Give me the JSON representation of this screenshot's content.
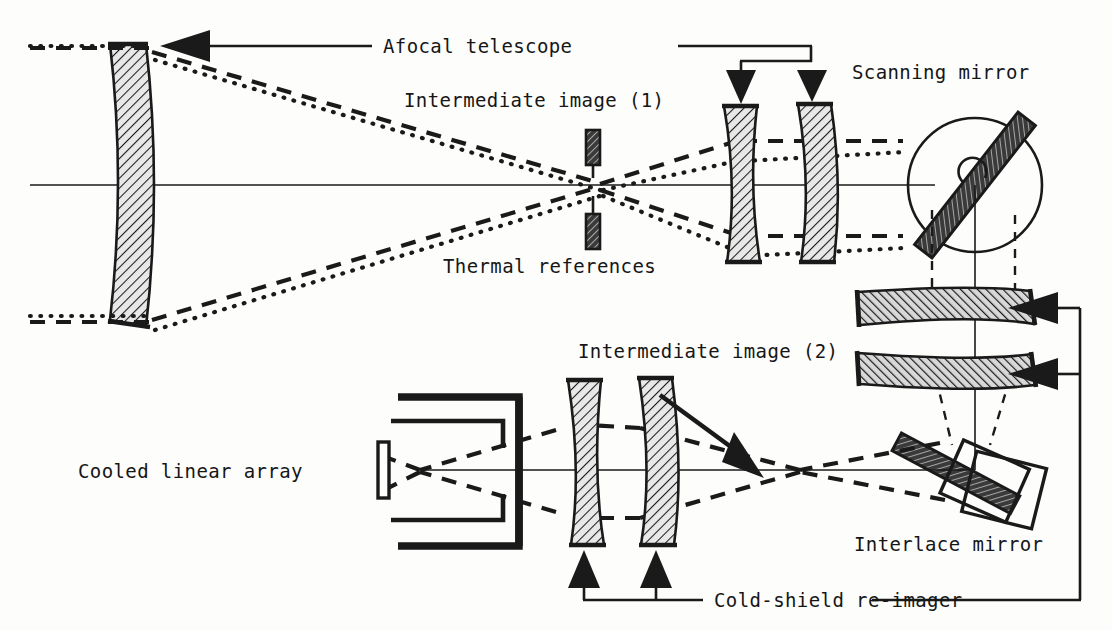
{
  "figure": {
    "kind": "optical-system-schematic",
    "title_visible": false,
    "background_color": "#fdfdfb",
    "ink_color": "#1a1a1a"
  },
  "labels": {
    "afocal_telescope": "Afocal telescope",
    "intermediate_image_1": "Intermediate image (1)",
    "scanning_mirror": "Scanning mirror",
    "thermal_references": "Thermal references",
    "intermediate_image_2": "Intermediate image (2)",
    "cooled_linear_array": "Cooled linear array",
    "interlace_mirror": "Interlace mirror",
    "cold_shield_reimager": "Cold-shield re-imager"
  },
  "components": [
    {
      "name": "objective-lens",
      "type": "meniscus-lens",
      "orientation": "vertical",
      "hatched": true
    },
    {
      "name": "thermal-reference-bar-upper",
      "type": "hatched-bar",
      "orientation": "vertical"
    },
    {
      "name": "thermal-reference-bar-lower",
      "type": "hatched-bar",
      "orientation": "vertical"
    },
    {
      "name": "telescope-eyepiece-lens-1",
      "type": "meniscus-lens",
      "orientation": "vertical",
      "hatched": true
    },
    {
      "name": "telescope-eyepiece-lens-2",
      "type": "meniscus-lens",
      "orientation": "vertical",
      "hatched": true
    },
    {
      "name": "scanning-mirror",
      "type": "rotating-flat-mirror",
      "orientation": "diagonal",
      "hatched": true
    },
    {
      "name": "relay-lens-upper",
      "type": "meniscus-lens",
      "orientation": "horizontal",
      "hatched": true
    },
    {
      "name": "relay-lens-lower",
      "type": "meniscus-lens",
      "orientation": "horizontal",
      "hatched": true
    },
    {
      "name": "interlace-mirror",
      "type": "oscillating-flat-mirror",
      "orientation": "diagonal",
      "hatched": true
    },
    {
      "name": "cold-shield-lens-1",
      "type": "meniscus-lens",
      "orientation": "vertical",
      "hatched": true
    },
    {
      "name": "cold-shield-lens-2",
      "type": "meniscus-lens",
      "orientation": "vertical",
      "hatched": true
    },
    {
      "name": "dewar-cold-shield",
      "type": "bracket-housing"
    },
    {
      "name": "detector-array",
      "type": "linear-detector"
    }
  ],
  "ray_bundles": [
    {
      "name": "on-axis-dashed-bundle",
      "style": "dashed"
    },
    {
      "name": "off-axis-dotted-bundle",
      "style": "dotted"
    },
    {
      "name": "optical-axis",
      "style": "solid-thin"
    }
  ]
}
